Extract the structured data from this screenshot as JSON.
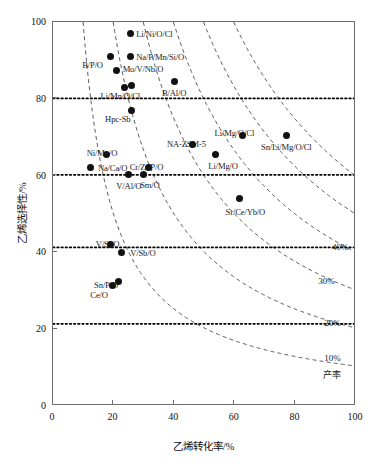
{
  "chart_data": {
    "type": "scatter",
    "title": "",
    "xlabel": "乙烯转化率/%",
    "ylabel": "乙烯选择性/%",
    "xlim": [
      0,
      100
    ],
    "ylim": [
      0,
      100
    ],
    "xticks": [
      "0",
      "20",
      "40",
      "60",
      "80",
      "100"
    ],
    "xtick_values": [
      0,
      20,
      40,
      60,
      80,
      100
    ],
    "yticks": [
      "0",
      "20",
      "40",
      "60",
      "80",
      "100"
    ],
    "ytick_values": [
      0,
      20,
      40,
      60,
      80,
      100
    ],
    "grid": false,
    "legend": "none",
    "points": [
      {
        "label": "Li/Ni/O/Cl",
        "x": 25.5,
        "y": 97.0,
        "label_side": "rgt"
      },
      {
        "label": "B/P/O",
        "x": 19.0,
        "y": 91.0,
        "label_side": "ctr"
      },
      {
        "label": "Na/P/Mn/Si/O",
        "x": 25.5,
        "y": 91.0,
        "label_side": "rgt"
      },
      {
        "label": "Mo/V/Nb/O",
        "x": 21.0,
        "y": 87.5,
        "label_side": "rgt"
      },
      {
        "label": "Li/Mn/O/Cl",
        "x": 23.5,
        "y": 83.0,
        "label_side": "ctr"
      },
      {
        "label": "",
        "x": 26.0,
        "y": 83.5,
        "label_side": "ctr"
      },
      {
        "label": "B/Al/O",
        "x": 40.0,
        "y": 84.5,
        "label_side": "ctr"
      },
      {
        "label": "Hpc-Sb",
        "x": 26.0,
        "y": 77.0,
        "label_side": "ctr"
      },
      {
        "label": "Li/Mg/O/Cl",
        "x": 62.5,
        "y": 70.5,
        "label_side": "ctr"
      },
      {
        "label": "Sn/Li/Mg/O/Cl",
        "x": 77.0,
        "y": 70.5,
        "label_side": "ctr"
      },
      {
        "label": "NA-ZSM-5",
        "x": 46.0,
        "y": 68.0,
        "label_side": "ctr"
      },
      {
        "label": "Ni/Mo/O",
        "x": 17.5,
        "y": 65.5,
        "label_side": "ctr"
      },
      {
        "label": "Li/Mg/O",
        "x": 53.5,
        "y": 65.5,
        "label_side": "ctr"
      },
      {
        "label": "Cr/Zr/P/O",
        "x": 31.5,
        "y": 62.0,
        "label_side": "ctr"
      },
      {
        "label": "Na/Ca/O",
        "x": 12.5,
        "y": 62.0,
        "label_side": "rgt"
      },
      {
        "label": "V/Al/O",
        "x": 25.0,
        "y": 60.3,
        "label_side": "ctr"
      },
      {
        "label": "Sm/O",
        "x": 30.0,
        "y": 60.3,
        "label_side": "ctr"
      },
      {
        "label": "Sr/Ce/Yb/O",
        "x": 61.5,
        "y": 54.0,
        "label_side": "ctr"
      },
      {
        "label": "V/Si/O",
        "x": 19.0,
        "y": 42.0,
        "label_side": "ctr"
      },
      {
        "label": "V/Sb/O",
        "x": 22.5,
        "y": 40.0,
        "label_side": "rgt"
      },
      {
        "label": "Sn/P/O",
        "x": 19.5,
        "y": 31.5,
        "label_side": "ctr"
      },
      {
        "label": "Ce/O",
        "x": 21.5,
        "y": 32.5,
        "label_side": "ctr"
      }
    ],
    "yield_curves": [
      {
        "label": "",
        "yield": 60,
        "show_label": false
      },
      {
        "label": "",
        "yield": 50,
        "show_label": false
      },
      {
        "label": "40%",
        "yield": 40,
        "show_label": true
      },
      {
        "label": "30%",
        "yield": 30,
        "show_label": true
      },
      {
        "label": "20%",
        "yield": 20,
        "show_label": true
      },
      {
        "label": "10%",
        "yield": 10,
        "show_label": true
      }
    ],
    "yield_note": "产率",
    "dotted_reference_lines": [
      80,
      60,
      41,
      21
    ]
  }
}
